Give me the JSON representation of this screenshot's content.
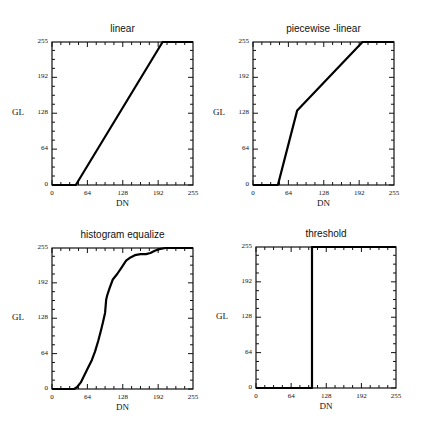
{
  "chart_data": [
    {
      "type": "line",
      "title": "linear",
      "xlabel": "DN",
      "ylabel": "GL",
      "xlim": [
        0,
        255
      ],
      "ylim": [
        0,
        255
      ],
      "xticks": [
        0,
        64,
        128,
        192,
        255
      ],
      "yticks": [
        0,
        64,
        128,
        192,
        255
      ],
      "grid": false,
      "series": [
        {
          "name": "linear",
          "x": [
            0,
            43,
            200,
            255
          ],
          "y": [
            0,
            0,
            255,
            255
          ]
        }
      ]
    },
    {
      "type": "line",
      "title": "piecewise -linear",
      "xlabel": "DN",
      "ylabel": "GL",
      "xlim": [
        0,
        255
      ],
      "ylim": [
        0,
        255
      ],
      "xticks": [
        0,
        64,
        128,
        192,
        255
      ],
      "yticks": [
        0,
        64,
        128,
        192,
        255
      ],
      "grid": false,
      "series": [
        {
          "name": "piecewise-linear",
          "x": [
            0,
            45,
            80,
            198,
            255
          ],
          "y": [
            0,
            0,
            133,
            255,
            255
          ]
        }
      ]
    },
    {
      "type": "line",
      "title": "histogram equalize",
      "xlabel": "DN",
      "ylabel": "GL",
      "xlim": [
        0,
        255
      ],
      "ylim": [
        0,
        255
      ],
      "xticks": [
        0,
        64,
        128,
        192,
        255
      ],
      "yticks": [
        0,
        64,
        128,
        192,
        255
      ],
      "grid": false,
      "series": [
        {
          "name": "histogram equalize",
          "x": [
            0,
            40,
            45,
            52,
            58,
            65,
            72,
            78,
            84,
            88,
            92,
            96,
            98,
            100,
            104,
            110,
            118,
            126,
            134,
            142,
            150,
            160,
            170,
            178,
            186,
            194,
            205,
            220,
            255
          ],
          "y": [
            0,
            0,
            3,
            12,
            24,
            38,
            52,
            68,
            88,
            104,
            120,
            138,
            162,
            170,
            182,
            198,
            208,
            220,
            232,
            238,
            242,
            244,
            244,
            246,
            250,
            253,
            255,
            255,
            255
          ]
        }
      ]
    },
    {
      "type": "line",
      "title": "threshold",
      "xlabel": "DN",
      "ylabel": "GL",
      "xlim": [
        0,
        255
      ],
      "ylim": [
        0,
        255
      ],
      "xticks": [
        0,
        64,
        128,
        192,
        255
      ],
      "yticks": [
        0,
        64,
        128,
        192,
        255
      ],
      "grid": false,
      "series": [
        {
          "name": "threshold",
          "x": [
            0,
            102,
            102,
            255
          ],
          "y": [
            0,
            0,
            255,
            255
          ]
        }
      ]
    }
  ],
  "panels": [
    {
      "title": "linear",
      "xlabel": "DN",
      "ylabel": "GL",
      "xticks": [
        "0",
        "64",
        "128",
        "192",
        "255"
      ],
      "yticks": [
        "0",
        "64",
        "128",
        "192",
        "255"
      ]
    },
    {
      "title": "piecewise -linear",
      "xlabel": "DN",
      "ylabel": "GL",
      "xticks": [
        "0",
        "64",
        "128",
        "192",
        "255"
      ],
      "yticks": [
        "0",
        "64",
        "128",
        "192",
        "255"
      ]
    },
    {
      "title": "histogram equalize",
      "xlabel": "DN",
      "ylabel": "GL",
      "xticks": [
        "0",
        "64",
        "128",
        "192",
        "255"
      ],
      "yticks": [
        "0",
        "64",
        "128",
        "192",
        "255"
      ]
    },
    {
      "title": "threshold",
      "xlabel": "DN",
      "ylabel": "GL",
      "xticks": [
        "0",
        "64",
        "128",
        "192",
        "255"
      ],
      "yticks": [
        "0",
        "64",
        "128",
        "192",
        "255"
      ]
    }
  ]
}
